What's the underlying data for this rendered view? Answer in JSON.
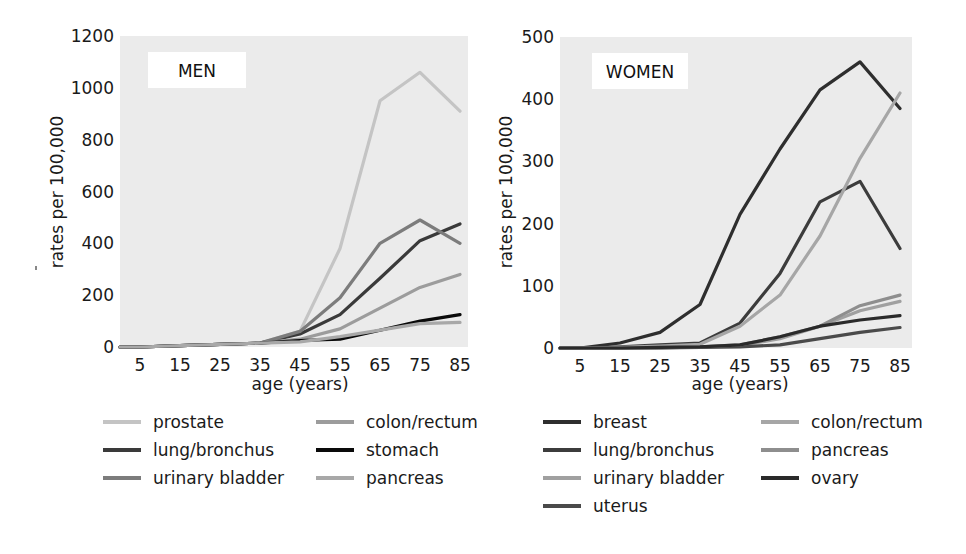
{
  "chart_data": [
    {
      "type": "line",
      "title": "MEN",
      "xlabel": "age (years)",
      "ylabel": "rates per 100,000",
      "x": [
        0,
        5,
        15,
        25,
        35,
        45,
        55,
        65,
        75,
        85
      ],
      "x_tick_labels": [
        "5",
        "15",
        "25",
        "35",
        "45",
        "55",
        "65",
        "75",
        "85"
      ],
      "y_tick_labels": [
        "0",
        "200",
        "400",
        "600",
        "800",
        "1000",
        "1200"
      ],
      "ylim": [
        0,
        1200
      ],
      "grid": false,
      "legend_position": "below",
      "series": [
        {
          "name": "prostate",
          "color": "#c4c4c4",
          "values": [
            0,
            0,
            5,
            10,
            15,
            60,
            380,
            950,
            1060,
            910
          ]
        },
        {
          "name": "lung/bronchus",
          "color": "#3a3a3a",
          "values": [
            0,
            0,
            5,
            10,
            15,
            50,
            125,
            265,
            410,
            475
          ]
        },
        {
          "name": "urinary bladder",
          "color": "#7c7c7c",
          "values": [
            0,
            0,
            5,
            10,
            15,
            60,
            190,
            400,
            490,
            400
          ]
        },
        {
          "name": "colon/rectum",
          "color": "#9c9c9c",
          "values": [
            0,
            0,
            5,
            10,
            15,
            30,
            70,
            150,
            230,
            280
          ]
        },
        {
          "name": "stomach",
          "color": "#0a0a0a",
          "values": [
            0,
            0,
            5,
            10,
            15,
            25,
            30,
            65,
            100,
            125
          ]
        },
        {
          "name": "pancreas",
          "color": "#a8a8a8",
          "values": [
            0,
            0,
            5,
            10,
            15,
            20,
            40,
            65,
            90,
            95
          ]
        }
      ]
    },
    {
      "type": "line",
      "title": "WOMEN",
      "xlabel": "age (years)",
      "ylabel": "rates per 100,000",
      "x": [
        0,
        5,
        15,
        25,
        35,
        45,
        55,
        65,
        75,
        85
      ],
      "x_tick_labels": [
        "5",
        "15",
        "25",
        "35",
        "45",
        "55",
        "65",
        "75",
        "85"
      ],
      "y_tick_labels": [
        "0",
        "100",
        "200",
        "300",
        "400",
        "500"
      ],
      "ylim": [
        0,
        500
      ],
      "grid": false,
      "legend_position": "below",
      "series": [
        {
          "name": "breast",
          "color": "#2e2e2e",
          "values": [
            0,
            0,
            8,
            25,
            70,
            215,
            320,
            415,
            460,
            385
          ]
        },
        {
          "name": "lung/bronchus",
          "color": "#3c3c3c",
          "values": [
            0,
            0,
            2,
            5,
            8,
            40,
            120,
            235,
            268,
            160
          ]
        },
        {
          "name": "urinary bladder",
          "color": "#a0a0a0",
          "values": [
            0,
            0,
            0,
            0,
            2,
            4,
            15,
            35,
            60,
            75
          ]
        },
        {
          "name": "uterus",
          "color": "#4a4a4a",
          "values": [
            0,
            0,
            0,
            0,
            1,
            2,
            5,
            15,
            25,
            33
          ]
        },
        {
          "name": "colon/rectum",
          "color": "#a6a6a6",
          "values": [
            0,
            0,
            1,
            3,
            6,
            35,
            85,
            180,
            305,
            410
          ]
        },
        {
          "name": "pancreas",
          "color": "#8e8e8e",
          "values": [
            0,
            0,
            0,
            1,
            2,
            5,
            18,
            35,
            68,
            85
          ]
        },
        {
          "name": "ovary",
          "color": "#2a2a2a",
          "values": [
            0,
            0,
            0,
            1,
            2,
            5,
            18,
            35,
            45,
            52
          ]
        }
      ]
    }
  ],
  "men": {
    "title": "MEN",
    "xlabel": "age (years)",
    "ylabel": "rates per 100,000",
    "legend": [
      "prostate",
      "lung/bronchus",
      "urinary bladder",
      "colon/rectum",
      "stomach",
      "pancreas"
    ]
  },
  "women": {
    "title": "WOMEN",
    "xlabel": "age (years)",
    "ylabel": "rates per 100,000",
    "legend": [
      "breast",
      "lung/bronchus",
      "urinary bladder",
      "uterus",
      "colon/rectum",
      "pancreas",
      "ovary"
    ]
  },
  "colors": {
    "plot_background": "#ebebeb",
    "text": "#1a1a1a"
  }
}
